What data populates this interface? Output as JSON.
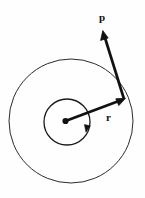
{
  "figure": {
    "name": "angular-momentum-diagram",
    "background_color": "#fefefe",
    "stroke_color": "#111111",
    "width": 145,
    "height": 198,
    "labels": {
      "momentum_vector": "p",
      "radius_vector": "r"
    },
    "geometry": {
      "center": {
        "x": 65.5,
        "y": 121
      },
      "outer_circle": {
        "cx": 71,
        "cy": 121,
        "r": 62,
        "stroke_width": 1
      },
      "inner_circle": {
        "cx": 67,
        "cy": 122,
        "r": 23,
        "stroke_width": 1.2
      },
      "center_dot": {
        "cx": 65.5,
        "cy": 121,
        "r": 3
      },
      "radius_vector": {
        "from": {
          "x": 65.5,
          "y": 121
        },
        "to": {
          "x": 124,
          "y": 99
        },
        "stroke_width": 2.6,
        "arrowhead": "at-tip"
      },
      "momentum_vector": {
        "from": {
          "x": 124,
          "y": 99
        },
        "to": {
          "x": 103,
          "y": 31
        },
        "stroke_width": 2.6,
        "arrowhead": "at-tip"
      },
      "rotation_arrow": {
        "on": "inner-circle",
        "position": {
          "x": 88,
          "y": 130
        },
        "direction": "counterclockwise"
      }
    }
  }
}
